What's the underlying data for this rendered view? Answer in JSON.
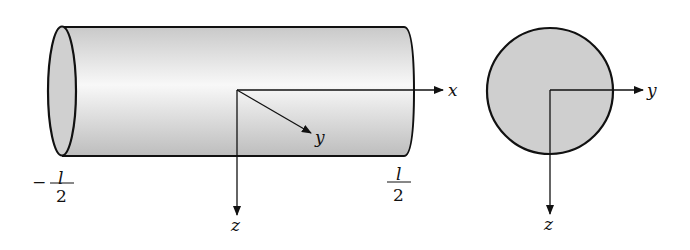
{
  "figure": {
    "cylinder_view": {
      "axis_labels": {
        "x": "x",
        "y": "y",
        "z": "z"
      },
      "left_end": {
        "sign": "−",
        "numerator": "l",
        "denominator": "2"
      },
      "right_end": {
        "numerator": "l",
        "denominator": "2"
      }
    },
    "cross_section_view": {
      "axis_labels": {
        "y": "y",
        "z": "z"
      }
    },
    "colors": {
      "stroke": "#111111",
      "fill_dark": "#c8c8c8",
      "fill_light": "#f6f6f6",
      "section_fill": "#cfcfcf"
    }
  }
}
